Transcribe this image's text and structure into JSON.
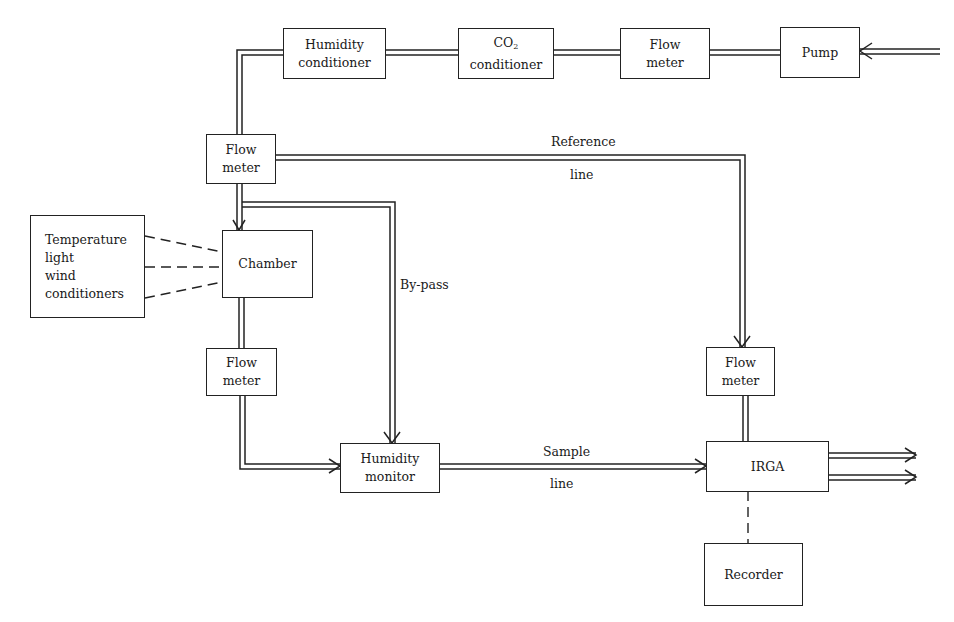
{
  "diagram": {
    "type": "flow-schematic",
    "boxes": {
      "humidity_conditioner": {
        "line1": "Humidity",
        "line2": "conditioner"
      },
      "co2_conditioner": {
        "line1_main": "CO",
        "line1_sub": "2",
        "line2": "conditioner"
      },
      "flow_meter_top": {
        "line1": "Flow",
        "line2": "meter"
      },
      "pump": {
        "line1": "Pump"
      },
      "flow_meter_left": {
        "line1": "Flow",
        "line2": "meter"
      },
      "env_conditioners": {
        "line1": "Temperature",
        "line2": "light",
        "line3": "wind",
        "line4": "conditioners"
      },
      "chamber": {
        "line1": "Chamber"
      },
      "flow_meter_lower": {
        "line1": "Flow",
        "line2": "meter"
      },
      "humidity_monitor": {
        "line1": "Humidity",
        "line2": "monitor"
      },
      "flow_meter_right": {
        "line1": "Flow",
        "line2": "meter"
      },
      "irga": {
        "line1": "IRGA"
      },
      "recorder": {
        "line1": "Recorder"
      }
    },
    "labels": {
      "reference_top": "Reference",
      "reference_bottom": "line",
      "bypass": "By-pass",
      "sample_top": "Sample",
      "sample_bottom": "line"
    },
    "colors": {
      "line": "#222222",
      "background": "#ffffff"
    }
  }
}
